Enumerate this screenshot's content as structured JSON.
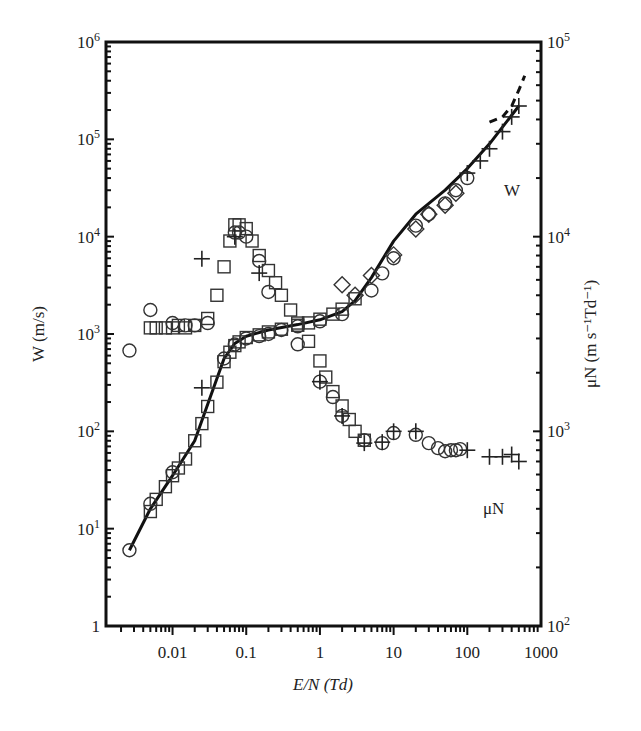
{
  "chart_data": {
    "type": "scatter",
    "title": "",
    "xlabel": "E/N (Td)",
    "ylabel_left": "W (m/s)",
    "ylabel_right": "μN (m s⁻¹Td⁻¹)",
    "xscale": "log",
    "yscale_left": "log",
    "yscale_right": "log",
    "xlim": [
      0.00125,
      1000
    ],
    "ylim_left": [
      1,
      1000000
    ],
    "ylim_right": [
      100,
      100000
    ],
    "grid": false,
    "legend": null,
    "x_ticks": [
      "0.01",
      "0.1",
      "1",
      "10",
      "100",
      "1000"
    ],
    "x_tick_values": [
      0.01,
      0.1,
      1,
      10,
      100,
      1000
    ],
    "y_left_ticks": [
      "1",
      "10^1",
      "10^2",
      "10^3",
      "10^4",
      "10^5",
      "10^6"
    ],
    "y_left_tick_values": [
      1,
      10,
      100,
      1000,
      10000,
      100000,
      1000000
    ],
    "y_right_ticks": [
      "10^2",
      "10^3",
      "10^4",
      "10^5"
    ],
    "y_right_tick_values": [
      100,
      1000,
      10000,
      100000
    ],
    "annotations": [
      {
        "text": "W",
        "near": "upper drift-velocity curve",
        "x": 350,
        "y_left": 25000
      },
      {
        "text": "μN",
        "near": "lower mobility curve",
        "x": 250,
        "y_right": 580
      }
    ],
    "series": [
      {
        "name": "W (drift velocity) — fitted curve",
        "axis": "left",
        "style": "solid-line",
        "x": [
          0.0026,
          0.005,
          0.01,
          0.02,
          0.03,
          0.05,
          0.07,
          0.1,
          0.2,
          0.5,
          1,
          2,
          3,
          5,
          10,
          20,
          50,
          100,
          200,
          500
        ],
        "y": [
          6,
          16,
          35,
          80,
          190,
          560,
          800,
          950,
          1100,
          1250,
          1400,
          1700,
          2200,
          3800,
          9000,
          17000,
          30000,
          50000,
          90000,
          220000
        ]
      },
      {
        "name": "W (drift velocity) — squares",
        "axis": "left",
        "marker": "square",
        "x": [
          0.005,
          0.006,
          0.008,
          0.01,
          0.012,
          0.015,
          0.02,
          0.025,
          0.03,
          0.04,
          0.05,
          0.06,
          0.07,
          0.08,
          0.1,
          0.15,
          0.2,
          0.3,
          0.5,
          0.7,
          1,
          1.5,
          2,
          3
        ],
        "y": [
          15,
          20,
          27,
          35,
          42,
          52,
          80,
          120,
          180,
          320,
          520,
          650,
          760,
          830,
          920,
          980,
          1050,
          1120,
          1230,
          1300,
          1420,
          1600,
          1800,
          2300
        ]
      },
      {
        "name": "W (drift velocity) — circles",
        "axis": "left",
        "marker": "circle",
        "x": [
          0.0026,
          0.005,
          0.01,
          0.05,
          0.07,
          0.1,
          0.15,
          0.2,
          0.3,
          0.5,
          1,
          2,
          5,
          7,
          10,
          20,
          30,
          50,
          70,
          100
        ],
        "y": [
          6,
          18,
          38,
          560,
          780,
          900,
          950,
          1000,
          1100,
          1200,
          1350,
          1600,
          2800,
          4200,
          6000,
          13000,
          17000,
          22000,
          30000,
          40000
        ]
      },
      {
        "name": "W (drift velocity) — diamonds",
        "axis": "left",
        "marker": "diamond",
        "x": [
          2,
          3,
          5,
          10,
          20,
          30,
          50,
          70
        ],
        "y": [
          3200,
          2500,
          4000,
          6500,
          12000,
          17000,
          21000,
          28000
        ]
      },
      {
        "name": "W (drift velocity) — crosses",
        "axis": "left",
        "marker": "plus",
        "x": [
          0.025,
          100,
          150,
          200,
          300,
          400,
          500
        ],
        "y": [
          280,
          45000,
          60000,
          80000,
          120000,
          170000,
          220000
        ]
      },
      {
        "name": "W (drift velocity) — dashed high-field",
        "axis": "left",
        "style": "dashed-line",
        "x": [
          200,
          300,
          400,
          500,
          600
        ],
        "y": [
          150000,
          170000,
          220000,
          320000,
          450000
        ]
      },
      {
        "name": "μN (mobility) — squares",
        "axis": "right",
        "marker": "square",
        "x": [
          0.005,
          0.006,
          0.008,
          0.01,
          0.012,
          0.015,
          0.02,
          0.03,
          0.04,
          0.05,
          0.06,
          0.07,
          0.08,
          0.1,
          0.12,
          0.15,
          0.2,
          0.25,
          0.3,
          0.4,
          0.5,
          0.7,
          1,
          1.2,
          1.5,
          2,
          2.5,
          3,
          4
        ],
        "y": [
          3400,
          3400,
          3400,
          3400,
          3500,
          3400,
          3500,
          3800,
          5000,
          7000,
          9500,
          11500,
          11500,
          11000,
          9500,
          8000,
          6700,
          5800,
          5000,
          4200,
          3600,
          2900,
          2300,
          1900,
          1600,
          1350,
          1150,
          1000,
          900
        ]
      },
      {
        "name": "μN (mobility) — circles",
        "axis": "right",
        "marker": "circle",
        "x": [
          0.0026,
          0.005,
          0.01,
          0.015,
          0.02,
          0.03,
          0.07,
          0.08,
          0.1,
          0.15,
          0.2,
          0.5,
          1,
          1.5,
          2,
          4,
          7,
          10,
          20,
          30,
          40,
          50,
          60,
          70,
          80
        ],
        "y": [
          2600,
          4200,
          3600,
          3500,
          3500,
          3600,
          10500,
          10500,
          10000,
          7500,
          5200,
          2800,
          1800,
          1500,
          1200,
          900,
          870,
          980,
          960,
          870,
          820,
          790,
          800,
          800,
          810
        ]
      },
      {
        "name": "μN (mobility) — crosses",
        "axis": "right",
        "marker": "plus",
        "x": [
          0.025,
          0.07,
          0.15,
          1,
          2,
          4,
          7,
          10,
          20,
          100,
          200,
          300,
          400,
          500
        ],
        "y": [
          7700,
          10000,
          6500,
          1800,
          1200,
          870,
          880,
          1000,
          1000,
          800,
          740,
          740,
          760,
          700
        ]
      }
    ]
  }
}
